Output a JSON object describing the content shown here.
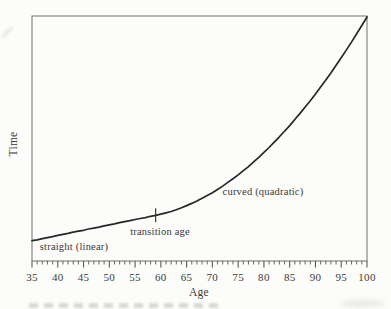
{
  "chart_data": {
    "type": "line",
    "title": "",
    "xlabel": "Age",
    "ylabel": "Time",
    "xlim": [
      35,
      100
    ],
    "ylim": [
      0,
      1
    ],
    "y_axis_note": "y axis unlabeled; relative time units",
    "grid": false,
    "frame": "full box; ticks on bottom axis only",
    "x_major_ticks": [
      35,
      40,
      45,
      50,
      55,
      60,
      65,
      70,
      75,
      80,
      85,
      90,
      95,
      100
    ],
    "x_minor_tick_step": 1,
    "series": [
      {
        "name": "time vs age curve",
        "x": [
          35,
          36,
          37,
          38,
          39,
          40,
          41,
          42,
          43,
          44,
          45,
          46,
          47,
          48,
          49,
          50,
          51,
          52,
          53,
          54,
          55,
          56,
          57,
          58,
          59,
          60,
          61,
          62,
          63,
          64,
          65,
          66,
          67,
          68,
          69,
          70,
          71,
          72,
          73,
          74,
          75,
          76,
          77,
          78,
          79,
          80,
          81,
          82,
          83,
          84,
          85,
          86,
          87,
          88,
          89,
          90,
          91,
          92,
          93,
          94,
          95,
          96,
          97,
          98,
          99,
          100
        ],
        "y": [
          0.083,
          0.087,
          0.092,
          0.096,
          0.1,
          0.105,
          0.109,
          0.113,
          0.118,
          0.122,
          0.126,
          0.131,
          0.135,
          0.139,
          0.144,
          0.148,
          0.152,
          0.157,
          0.161,
          0.165,
          0.17,
          0.174,
          0.178,
          0.183,
          0.187,
          0.192,
          0.197,
          0.203,
          0.21,
          0.218,
          0.227,
          0.236,
          0.246,
          0.257,
          0.268,
          0.28,
          0.293,
          0.307,
          0.322,
          0.337,
          0.353,
          0.37,
          0.387,
          0.406,
          0.425,
          0.445,
          0.465,
          0.487,
          0.509,
          0.532,
          0.555,
          0.58,
          0.605,
          0.631,
          0.657,
          0.685,
          0.713,
          0.742,
          0.771,
          0.802,
          0.833,
          0.865,
          0.897,
          0.931,
          0.965,
          1.0
        ]
      }
    ],
    "segments": [
      {
        "label": "straight (linear)",
        "age_range": [
          35,
          59
        ]
      },
      {
        "label": "curved (quadratic)",
        "age_range": [
          59,
          100
        ]
      }
    ],
    "transition_marker": {
      "age": 59,
      "y": 0.187,
      "style": "short vertical tick crossing the curve"
    },
    "annotations": [
      {
        "text": "straight (linear)",
        "age": 43,
        "px": [
          74,
          245.5
        ]
      },
      {
        "text": "transition age",
        "age": 59.5,
        "px": [
          160,
          230.5
        ]
      },
      {
        "text": "curved (quadratic)",
        "age": 79.5,
        "px": [
          263,
          191
        ]
      }
    ],
    "colors": {
      "curve": "#272727",
      "axis": "#6e6e6e",
      "tick": "#585858",
      "text": "#3a3a3a",
      "background": "#fcfcfa"
    }
  }
}
